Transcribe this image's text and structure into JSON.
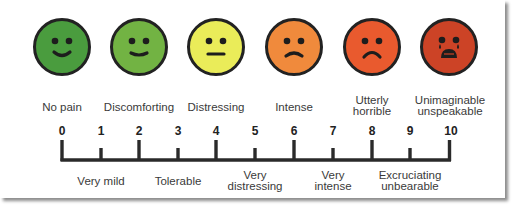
{
  "scale": {
    "title": "Pain scale 0-10",
    "faces": [
      {
        "level": 0,
        "icon": "smiling-face-icon",
        "color": "#4a9c3e",
        "mouth": "smile"
      },
      {
        "level": 2,
        "icon": "slight-smile-face-icon",
        "color": "#72b343",
        "mouth": "slight-smile"
      },
      {
        "level": 4,
        "icon": "neutral-face-icon",
        "color": "#eaec59",
        "mouth": "flat"
      },
      {
        "level": 6,
        "icon": "frowning-face-icon",
        "color": "#f08a3c",
        "mouth": "slight-frown"
      },
      {
        "level": 8,
        "icon": "sad-face-icon",
        "color": "#e95a2e",
        "mouth": "frown"
      },
      {
        "level": 10,
        "icon": "crying-face-icon",
        "color": "#cc4326",
        "mouth": "crying"
      }
    ],
    "top_labels": [
      {
        "level": 0,
        "text": "No pain"
      },
      {
        "level": 2,
        "text": "Discomforting"
      },
      {
        "level": 4,
        "text": "Distressing"
      },
      {
        "level": 6,
        "text": "Intense"
      },
      {
        "level": 8,
        "line1": "Utterly",
        "line2": "horrible"
      },
      {
        "level": 10,
        "line1": "Unimaginable",
        "line2": "unspeakable"
      }
    ],
    "numbers": [
      "0",
      "1",
      "2",
      "3",
      "4",
      "5",
      "6",
      "7",
      "8",
      "9",
      "10"
    ],
    "bottom_labels": [
      {
        "level": 1,
        "text": "Very mild"
      },
      {
        "level": 3,
        "text": "Tolerable"
      },
      {
        "level": 5,
        "line1": "Very",
        "line2": "distressing"
      },
      {
        "level": 7,
        "line1": "Very",
        "line2": "intense"
      },
      {
        "level": 9,
        "line1": "Excruciating",
        "line2": "unbearable"
      }
    ]
  }
}
